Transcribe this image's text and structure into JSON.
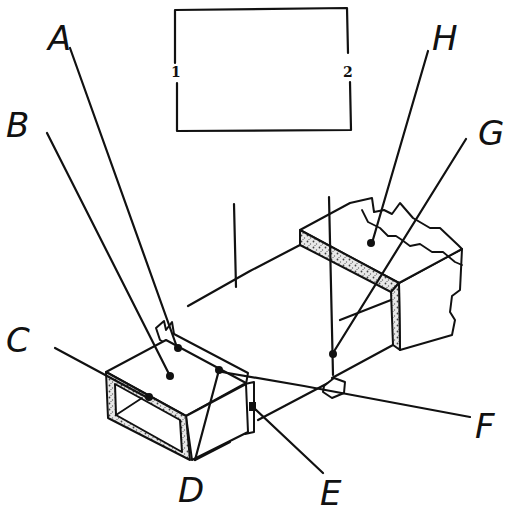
{
  "diagram": {
    "inset_box": {
      "left_terminal": "1",
      "right_terminal": "2"
    },
    "labels": {
      "A": "A",
      "B": "B",
      "C": "C",
      "D": "D",
      "E": "E",
      "F": "F",
      "G": "G",
      "H": "H"
    },
    "colors": {
      "line": "#111111",
      "background": "#ffffff"
    }
  }
}
